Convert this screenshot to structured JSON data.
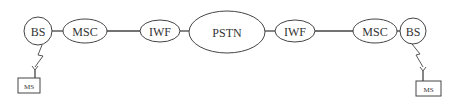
{
  "diagram": {
    "type": "network-topology",
    "stroke_color": "#444444",
    "text_color": "#333333",
    "nodes": [
      {
        "id": "bs-left",
        "label": "BS",
        "shape": "circle"
      },
      {
        "id": "msc-left",
        "label": "MSC",
        "shape": "ellipse"
      },
      {
        "id": "iwf-left",
        "label": "IWF",
        "shape": "ellipse"
      },
      {
        "id": "pstn",
        "label": "PSTN",
        "shape": "ellipse"
      },
      {
        "id": "iwf-right",
        "label": "IWF",
        "shape": "ellipse"
      },
      {
        "id": "msc-right",
        "label": "MSC",
        "shape": "ellipse"
      },
      {
        "id": "bs-right",
        "label": "BS",
        "shape": "circle"
      },
      {
        "id": "ms-left",
        "label": "MS",
        "shape": "rectangle"
      },
      {
        "id": "ms-right",
        "label": "MS",
        "shape": "rectangle"
      }
    ],
    "edges": [
      {
        "from": "bs-left",
        "to": "msc-left",
        "type": "wired"
      },
      {
        "from": "msc-left",
        "to": "iwf-left",
        "type": "wired"
      },
      {
        "from": "iwf-left",
        "to": "pstn",
        "type": "wired"
      },
      {
        "from": "pstn",
        "to": "iwf-right",
        "type": "wired"
      },
      {
        "from": "iwf-right",
        "to": "msc-right",
        "type": "wired"
      },
      {
        "from": "msc-right",
        "to": "bs-right",
        "type": "wired"
      },
      {
        "from": "bs-left",
        "to": "ms-left",
        "type": "wireless"
      },
      {
        "from": "bs-right",
        "to": "ms-right",
        "type": "wireless"
      }
    ]
  }
}
